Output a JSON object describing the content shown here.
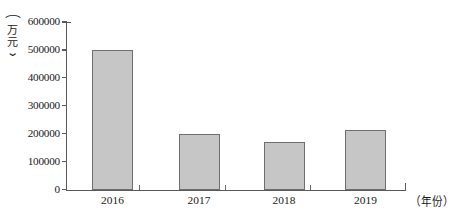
{
  "chart_data": {
    "type": "bar",
    "title": "",
    "xlabel": "（年份）",
    "ylabel": "（万元）",
    "categories": [
      "2016",
      "2017",
      "2018",
      "2019"
    ],
    "values": [
      500000,
      200000,
      173000,
      215000
    ],
    "ylim": [
      0,
      600000
    ],
    "ytick_labels": [
      "600000",
      "500000",
      "400000",
      "300000",
      "200000",
      "100000",
      "0"
    ],
    "ytick_values": [
      600000,
      500000,
      400000,
      300000,
      200000,
      100000,
      0
    ],
    "grid": false,
    "legend": null,
    "series": [
      {
        "name": "",
        "values": [
          500000,
          200000,
          173000,
          215000
        ]
      }
    ]
  },
  "style": {
    "bar_fill": "#c6c6c6",
    "bar_stroke": "#6e6e6e",
    "axis_color": "#5a5a5a",
    "text_color": "#1a1a1a",
    "background": "#ffffff"
  },
  "y_unit_parts": {
    "paren_open": "⌒",
    "char1": "万",
    "char2": "元",
    "paren_close": "⌄"
  }
}
